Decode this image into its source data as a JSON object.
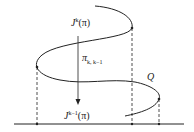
{
  "diagram": {
    "labels": {
      "top_J": "J",
      "top_sup": "k",
      "top_arg": "(π)",
      "proj_pi": "π",
      "proj_sub": "k, k−1",
      "bottom_J": "J",
      "bottom_sup": "k−1",
      "bottom_arg": "(π)",
      "Q": "Q"
    },
    "colors": {
      "stroke": "#222222",
      "background": "#ffffff"
    }
  }
}
